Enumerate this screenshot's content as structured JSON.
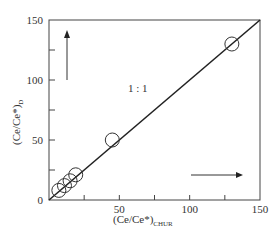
{
  "chart_data": {
    "type": "scatter",
    "title": "",
    "xlabel": "(Ce/Ce*)CHUR",
    "xlabel_main": "(Ce/Ce*)",
    "xlabel_sub": "CHUR",
    "ylabel": "(Ce/Ce*)D",
    "ylabel_main": "(Ce/Ce*)",
    "ylabel_sub": "D",
    "xlim": [
      0,
      150
    ],
    "ylim": [
      0,
      150
    ],
    "x_ticks": [
      0,
      25,
      50,
      75,
      100,
      125,
      150
    ],
    "x_tick_labels": [
      "",
      "",
      "50",
      "",
      "100",
      "",
      "150"
    ],
    "y_ticks": [
      0,
      25,
      50,
      75,
      100,
      125,
      150
    ],
    "y_tick_labels": [
      "0",
      "",
      "50",
      "",
      "100",
      "",
      "150"
    ],
    "grid": false,
    "legend": null,
    "reference_line": {
      "label": "1 : 1",
      "x": [
        0,
        150
      ],
      "y": [
        0,
        150
      ]
    },
    "points": [
      {
        "x": 7,
        "y": 8
      },
      {
        "x": 11,
        "y": 12
      },
      {
        "x": 15,
        "y": 16
      },
      {
        "x": 19,
        "y": 21
      },
      {
        "x": 45,
        "y": 50
      },
      {
        "x": 130,
        "y": 130
      }
    ],
    "annotations": [
      {
        "type": "arrow",
        "direction": "up",
        "note": "vertical arrow near y-axis"
      },
      {
        "type": "arrow",
        "direction": "right",
        "note": "horizontal arrow near x-axis"
      },
      {
        "type": "text",
        "text": "1 : 1"
      }
    ],
    "marker": "open-circle",
    "line_color": "#222222"
  }
}
